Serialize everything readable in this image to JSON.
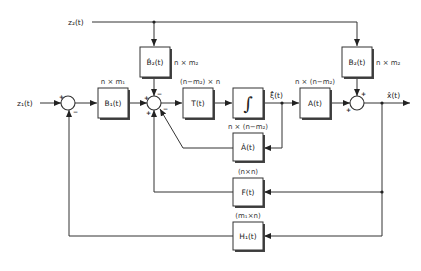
{
  "diagram": {
    "type": "block-diagram",
    "signals": {
      "z1": "z₁(t)",
      "z2": "z₂(t)",
      "xi_hat": "ξ̂(t)",
      "x_hat": "x̂(t)"
    },
    "blocks": {
      "B1": {
        "label": "B₁(t)",
        "dim": "n × m₁"
      },
      "B2dot": {
        "label": "Ḃ₂(t)",
        "dim": "n × m₂"
      },
      "T": {
        "label": "T(t)",
        "dim": "(n−m₂) × n"
      },
      "integrator": {
        "label": "∫"
      },
      "A": {
        "label": "A(t)",
        "dim": "n × (n−m₂)"
      },
      "Adot": {
        "label": "Ȧ(t)",
        "dim": "n × (n−m₂)"
      },
      "B2": {
        "label": "B₂(t)",
        "dim": "n × m₂"
      },
      "F": {
        "label": "F(t)",
        "dim": "(n×n)"
      },
      "H1": {
        "label": "H₁(t)",
        "dim": "(m₁×n)"
      }
    },
    "signs": {
      "sum1_in": "+",
      "sum1_fb": "−",
      "sum2_left": "+",
      "sum2_top": "−",
      "sum2_bottom": "+",
      "sum2_adot": "−",
      "sum3_left": "+",
      "sum3_top": "+"
    }
  }
}
